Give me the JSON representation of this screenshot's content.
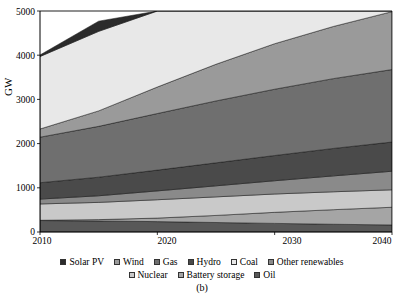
{
  "figure": {
    "caption": "(b)",
    "width": 404,
    "height": 300
  },
  "chart_data": {
    "type": "area",
    "stacked": true,
    "title": "",
    "subtitle": "",
    "xlabel": "",
    "ylabel": "GW",
    "x": [
      2010,
      2015,
      2020,
      2025,
      2030,
      2035,
      2040
    ],
    "xlim": [
      2010,
      2040
    ],
    "ylim": [
      0,
      5000
    ],
    "xticks": [
      "2010",
      "2020",
      "2030",
      "2040"
    ],
    "yticks": [
      "0",
      "1000",
      "2000",
      "3000",
      "4000",
      "5000"
    ],
    "grid": "horizontal",
    "legend_position": "bottom",
    "legend_rows": [
      [
        "Solar PV",
        "Wind",
        "Gas",
        "Hydro",
        "Coal",
        "Other renewables"
      ],
      [
        "Nuclear",
        "Battery storage",
        "Oil"
      ]
    ],
    "series": [
      {
        "name": "Solar PV",
        "color": "#2b2b2b",
        "values": [
          35,
          230,
          600,
          1080,
          1560,
          2180,
          2980
        ]
      },
      {
        "name": "Wind",
        "color": "#9a9a9a",
        "values": [
          185,
          350,
          600,
          830,
          1030,
          1180,
          1310
        ]
      },
      {
        "name": "Gas",
        "color": "#6f6f6f",
        "values": [
          1030,
          1150,
          1280,
          1400,
          1500,
          1580,
          1640
        ]
      },
      {
        "name": "Hydro",
        "color": "#4a4a4a",
        "values": [
          370,
          420,
          470,
          520,
          570,
          620,
          660
        ]
      },
      {
        "name": "Coal",
        "color": "#e8e8e8",
        "values": [
          1640,
          1800,
          1940,
          1780,
          1560,
          1330,
          1140
        ]
      },
      {
        "name": "Other renewables",
        "color": "#8a8a8a",
        "values": [
          110,
          150,
          200,
          250,
          300,
          360,
          420
        ]
      },
      {
        "name": "Nuclear",
        "color": "#c9c9c9",
        "values": [
          370,
          390,
          415,
          420,
          415,
          405,
          395
        ]
      },
      {
        "name": "Battery storage",
        "color": "#a5a5a5",
        "values": [
          5,
          30,
          80,
          160,
          250,
          330,
          400
        ]
      },
      {
        "name": "Oil",
        "color": "#585858",
        "values": [
          260,
          250,
          235,
          215,
          195,
          175,
          160
        ]
      }
    ],
    "stack_order_bottom_to_top": [
      "Oil",
      "Battery storage",
      "Nuclear",
      "Other renewables",
      "Hydro",
      "Gas",
      "Wind",
      "Coal",
      "Solar PV"
    ],
    "notes": {
      "total_2010": 4005,
      "total_2040": 9105,
      "top_of_stack_visible_2010": 1640,
      "top_of_stack_visible_2040": 4280
    }
  },
  "axes": {
    "y_axis_label": "GW",
    "y_tick_values": [
      0,
      1000,
      2000,
      3000,
      4000,
      5000
    ],
    "x_tick_values": [
      2010,
      2020,
      2030,
      2040
    ]
  }
}
